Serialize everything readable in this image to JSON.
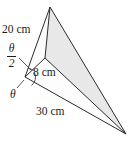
{
  "figure": {
    "background_color": "#ffffff",
    "stroke_color": "#2b2b2b",
    "shaded_face_color": "#e8e8e8",
    "labels": {
      "edge_upper_left": "20 cm",
      "edge_short": "8 cm",
      "edge_base": "30 cm",
      "angle_half_numerator": "θ",
      "angle_half_denominator": "2",
      "angle_full": "θ"
    },
    "vertices": {
      "apex": {
        "x": 50,
        "y": 7
      },
      "junction": {
        "x": 45,
        "y": 58
      },
      "left": {
        "x": 25,
        "y": 77
      },
      "right": {
        "x": 126,
        "y": 134
      }
    },
    "edges": [
      {
        "name": "apex-to-left",
        "from": "apex",
        "to": "left",
        "label": "20 cm"
      },
      {
        "name": "apex-to-junction",
        "from": "apex",
        "to": "junction",
        "label": ""
      },
      {
        "name": "apex-to-right",
        "from": "apex",
        "to": "right",
        "label": ""
      },
      {
        "name": "junction-to-left",
        "from": "junction",
        "to": "left",
        "label": "8 cm"
      },
      {
        "name": "junction-to-right",
        "from": "junction",
        "to": "right",
        "label": ""
      },
      {
        "name": "left-to-right",
        "from": "left",
        "to": "right",
        "label": "30 cm"
      }
    ],
    "shaded_face": {
      "name": "apex-junction-right-face",
      "vertices": [
        "apex",
        "junction",
        "right"
      ]
    },
    "angle_marks": [
      {
        "name": "half-angle-mark",
        "at": "left",
        "label": "θ/2"
      },
      {
        "name": "full-angle-mark",
        "at": "left",
        "label": "θ"
      }
    ]
  }
}
